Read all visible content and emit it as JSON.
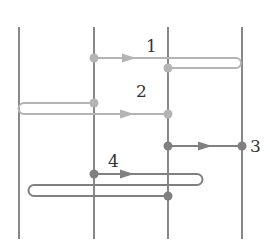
{
  "diagram": {
    "width": 270,
    "height": 251,
    "background": "#ffffff",
    "vertical_lines": {
      "color": "#555555",
      "stroke_width": 1.4,
      "y_top": 27,
      "y_bottom": 239,
      "x_positions": [
        19,
        94,
        168,
        242
      ]
    },
    "colors": {
      "light": "#b4b4b4",
      "dark": "#808080",
      "label": "#333333"
    },
    "flows": [
      {
        "id": "1",
        "label": "1",
        "tone": "light",
        "label_pos": [
          146,
          52
        ],
        "start_dot": [
          94,
          58
        ],
        "end_dot": [
          168,
          68
        ],
        "arrow": {
          "x": 130,
          "y": 58,
          "dir": "right"
        },
        "path": "M94 58 L236 58 A5 5 0 0 1 236 68 L168 68"
      },
      {
        "id": "2",
        "label": "2",
        "tone": "light",
        "label_pos": [
          136,
          97
        ],
        "start_dot": [
          94,
          103
        ],
        "end_dot": [
          168,
          114
        ],
        "arrow": {
          "x": 128,
          "y": 114,
          "dir": "right"
        },
        "path": "M94 103 L24 103 A5.5 5.5 0 0 0 24 114 L168 114"
      },
      {
        "id": "3",
        "label": "3",
        "tone": "dark",
        "label_pos": [
          250,
          152
        ],
        "start_dot": [
          168,
          146
        ],
        "end_dot": [
          242,
          146
        ],
        "arrow": {
          "x": 206,
          "y": 146,
          "dir": "right"
        },
        "path": "M168 146 L242 146"
      },
      {
        "id": "4",
        "label": "4",
        "tone": "dark",
        "label_pos": [
          108,
          167
        ],
        "start_dot": [
          94,
          174
        ],
        "end_dot": [
          168,
          196
        ],
        "arrow": {
          "x": 128,
          "y": 174,
          "dir": "right"
        },
        "path": "M94 174 L197 174 A5.5 5.5 0 0 1 197 185 L34 185 A5.5 5.5 0 0 0 34 196 L168 196"
      }
    ]
  }
}
